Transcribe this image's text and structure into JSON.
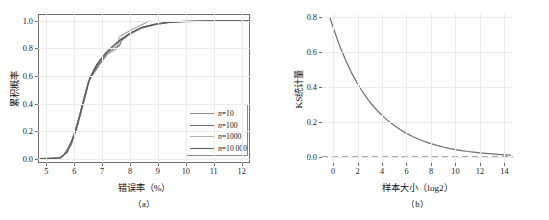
{
  "figure": {
    "panel_a_caption": "（a）",
    "panel_b_caption": "（b）"
  },
  "chart_data": [
    {
      "type": "line",
      "panel": "a",
      "title": "",
      "xlabel": "错误率（%）",
      "ylabel": "累积概率",
      "xlim": [
        4.7,
        12.3
      ],
      "ylim": [
        -0.03,
        1.05
      ],
      "xticks": [
        5,
        6,
        7,
        8,
        9,
        10,
        11,
        12
      ],
      "yticks": [
        "0.0",
        "0.2",
        "0.4",
        "0.6",
        "0.8",
        "1.0"
      ],
      "ytick_values": [
        0.0,
        0.2,
        0.4,
        0.6,
        0.8,
        1.0
      ],
      "grid": true,
      "legend_position": "lower right",
      "series": [
        {
          "name": "n=10",
          "label_prefix": "n",
          "label_value": "=10",
          "color": "#8f8f8f",
          "width": 1.0,
          "x": [
            4.8,
            5.5,
            5.9,
            6.2,
            6.45,
            6.5,
            6.55,
            6.9,
            7.2,
            7.55,
            7.6,
            7.65,
            8.0,
            8.4,
            8.7
          ],
          "y": [
            0.0,
            0.0,
            0.1,
            0.3,
            0.5,
            0.56,
            0.57,
            0.68,
            0.76,
            0.8,
            0.88,
            0.89,
            0.93,
            0.97,
            1.0
          ]
        },
        {
          "name": "n=100",
          "label_prefix": "n",
          "label_value": "=100",
          "color": "#6d6d6d",
          "width": 1.1,
          "x": [
            4.8,
            5.4,
            5.6,
            5.9,
            6.2,
            6.45,
            6.5,
            6.6,
            6.9,
            7.2,
            7.5,
            7.62,
            7.7,
            8.0,
            8.4,
            8.9,
            9.4,
            10.0,
            11.0,
            12.25
          ],
          "y": [
            0.0,
            0.0,
            0.02,
            0.12,
            0.32,
            0.52,
            0.55,
            0.6,
            0.69,
            0.77,
            0.81,
            0.82,
            0.86,
            0.91,
            0.95,
            0.975,
            0.99,
            0.997,
            1.0,
            1.0
          ]
        },
        {
          "name": "n=1000",
          "label_prefix": "n",
          "label_value": "=1000",
          "color": "#b4b4b4",
          "width": 1.0,
          "x": [
            4.8,
            5.45,
            5.7,
            6.0,
            6.3,
            6.5,
            6.7,
            7.0,
            7.3,
            7.6,
            7.7,
            8.0,
            8.4,
            8.9,
            9.4,
            10.0,
            11.0,
            12.25
          ],
          "y": [
            0.0,
            0.005,
            0.04,
            0.17,
            0.4,
            0.55,
            0.65,
            0.73,
            0.79,
            0.84,
            0.855,
            0.9,
            0.945,
            0.972,
            0.988,
            0.996,
            1.0,
            1.0
          ]
        },
        {
          "name": "n=10 000",
          "label_prefix": "n",
          "label_value": "=10 000",
          "color": "#5a5a5a",
          "width": 1.5,
          "x": [
            4.8,
            5.5,
            5.75,
            6.05,
            6.35,
            6.55,
            6.8,
            7.1,
            7.4,
            7.7,
            8.0,
            8.4,
            8.9,
            9.4,
            10.0,
            10.8,
            11.5,
            12.25
          ],
          "y": [
            0.0,
            0.008,
            0.05,
            0.2,
            0.43,
            0.58,
            0.68,
            0.76,
            0.82,
            0.87,
            0.91,
            0.95,
            0.975,
            0.99,
            0.996,
            1.0,
            1.0,
            1.0
          ]
        }
      ]
    },
    {
      "type": "line",
      "panel": "b",
      "title": "",
      "xlabel": "样本大小（log2）",
      "ylabel": "KS统计量",
      "xlim": [
        -0.9,
        14.7
      ],
      "ylim": [
        -0.035,
        0.82
      ],
      "xticks": [
        0,
        2,
        4,
        6,
        8,
        10,
        12,
        14
      ],
      "yticks": [
        "0.0",
        "0.2",
        "0.4",
        "0.6",
        "0.8"
      ],
      "ytick_values": [
        0.0,
        0.2,
        0.4,
        0.6,
        0.8
      ],
      "grid": true,
      "series": [
        {
          "name": "KS统计量",
          "color": "#707070",
          "width": 1.2,
          "x": [
            -0.25,
            0,
            0.5,
            1,
            1.5,
            2,
            2.5,
            3,
            3.5,
            4,
            4.5,
            5,
            5.5,
            6,
            6.5,
            7,
            7.5,
            8,
            8.5,
            9,
            9.5,
            10,
            10.5,
            11,
            11.5,
            12,
            12.5,
            13,
            13.5,
            14,
            14.5
          ],
          "y": [
            0.8,
            0.745,
            0.645,
            0.56,
            0.485,
            0.42,
            0.365,
            0.315,
            0.275,
            0.238,
            0.207,
            0.18,
            0.156,
            0.135,
            0.117,
            0.101,
            0.088,
            0.076,
            0.066,
            0.057,
            0.049,
            0.042,
            0.036,
            0.031,
            0.027,
            0.023,
            0.02,
            0.017,
            0.014,
            0.012,
            0.01
          ]
        }
      ],
      "reference_line": {
        "name": "zero-reference",
        "y": 0.0,
        "style": "dashed",
        "color": "#8a8a8a"
      }
    }
  ]
}
